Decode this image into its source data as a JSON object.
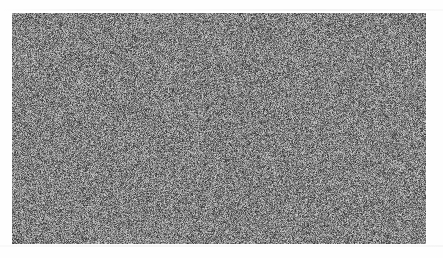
{
  "figure": {
    "kind": "random-noise-plate",
    "canvas_width": 443,
    "canvas_height": 258,
    "background_color": "#fefefe",
    "noise_field": {
      "x": 12,
      "y": 13,
      "width": 414,
      "height": 231,
      "pattern": "uncorrelated grayscale pixel noise",
      "grain_size_px": 1,
      "mean_gray": "#808080",
      "min_gray": "#1a1a1a",
      "max_gray": "#ebebeb",
      "seed": 20240517
    },
    "margins": {
      "left": 12,
      "top": 13,
      "right": 17,
      "bottom": 14,
      "color": "#fefefe"
    },
    "scan_artifacts": {
      "top_streak": {
        "x": 0,
        "y": 9,
        "width": 443,
        "height": 2
      },
      "bottom_streak": {
        "x": 0,
        "y": 245,
        "width": 443,
        "height": 2
      }
    }
  }
}
